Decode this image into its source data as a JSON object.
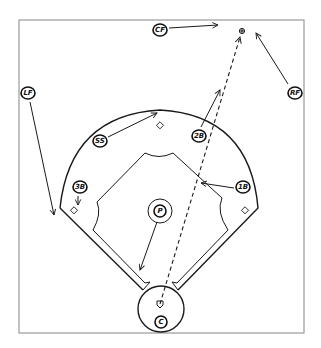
{
  "diagram": {
    "title": "",
    "frame": {
      "x1": 19,
      "y1": 20,
      "x2": 304,
      "y2": 333,
      "color": "#9a9a9a"
    },
    "field": {
      "outfield_arc": {
        "left": [
          60,
          208
        ],
        "right": [
          258,
          208
        ],
        "apex_y": 110
      },
      "home_circle": {
        "cx": 161,
        "cy": 309,
        "r": 23
      },
      "mound": {
        "cx": 160,
        "cy": 211,
        "r": 12
      }
    },
    "bases": [
      {
        "name": "third-base",
        "x": 74,
        "y": 211
      },
      {
        "name": "second-base",
        "x": 160,
        "y": 126
      },
      {
        "name": "first-base",
        "x": 245,
        "y": 211
      },
      {
        "name": "home-plate",
        "x": 160,
        "y": 304
      }
    ],
    "ball_target": {
      "x": 242,
      "y": 31,
      "symbol": "⊕"
    },
    "players": [
      {
        "id": "cf",
        "label": "CF",
        "x": 160,
        "y": 30
      },
      {
        "id": "lf",
        "label": "LF",
        "x": 28,
        "y": 93
      },
      {
        "id": "rf",
        "label": "RF",
        "x": 295,
        "y": 93
      },
      {
        "id": "ss",
        "label": "SS",
        "x": 100,
        "y": 141
      },
      {
        "id": "2b",
        "label": "2B",
        "x": 199,
        "y": 136
      },
      {
        "id": "3b",
        "label": "3B",
        "x": 80,
        "y": 187
      },
      {
        "id": "1b",
        "label": "1B",
        "x": 243,
        "y": 187
      },
      {
        "id": "p",
        "label": "P",
        "x": 160,
        "y": 211
      },
      {
        "id": "c",
        "label": "C",
        "x": 161,
        "y": 322
      }
    ],
    "movements": [
      {
        "player": "CF",
        "from": [
          169,
          28
        ],
        "to": [
          218,
          25
        ]
      },
      {
        "player": "RF",
        "from": [
          288,
          84
        ],
        "to": [
          256,
          33
        ]
      },
      {
        "player": "LF",
        "from": [
          30,
          102
        ],
        "to": [
          54,
          215
        ]
      },
      {
        "player": "SS",
        "from": [
          108,
          137
        ],
        "to": [
          157,
          113
        ]
      },
      {
        "player": "2B",
        "from": [
          201,
          127
        ],
        "to": [
          220,
          90
        ]
      },
      {
        "player": "3B",
        "from": [
          78,
          196
        ],
        "to": [
          78,
          205
        ]
      },
      {
        "player": "1B",
        "from": [
          234,
          188
        ],
        "to": [
          201,
          183
        ]
      },
      {
        "player": "P",
        "from": [
          157,
          222
        ],
        "to": [
          140,
          270
        ]
      }
    ],
    "ball_path": {
      "from": [
        160,
        304
      ],
      "to": [
        240,
        37
      ],
      "style": "dashed"
    }
  }
}
